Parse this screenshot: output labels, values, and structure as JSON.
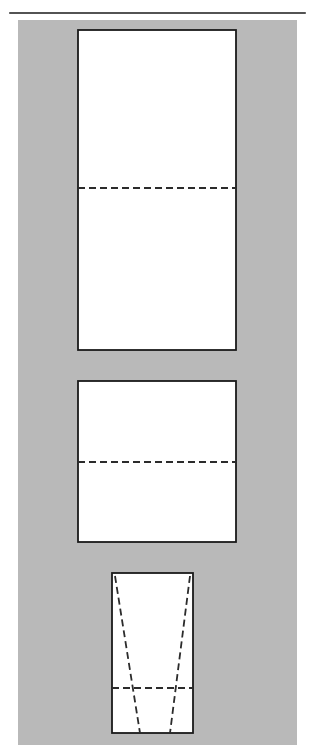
{
  "page": {
    "width": 315,
    "height": 755,
    "background_color": "#ffffff"
  },
  "colors": {
    "background": "#ffffff",
    "panel_gray": "#b9b9b9",
    "shape_fill": "#ffffff",
    "stroke": "#1a1a1a",
    "dashed_stroke": "#2b2b2b"
  },
  "top_rule": {
    "label": "horizontal-rule",
    "x1": 10,
    "y1": 13,
    "x2": 305,
    "y2": 13,
    "stroke_width": 1.6
  },
  "gray_panel": {
    "label": "gray-background-panel",
    "x": 18,
    "y": 20,
    "width": 279,
    "height": 725
  },
  "shapes": [
    {
      "id": "panel-1",
      "name": "upper-rectangle",
      "type": "rectangle",
      "x": 78,
      "y": 30,
      "width": 158,
      "height": 320,
      "stroke_width": 1.8,
      "fold_lines": [
        {
          "name": "horizontal-fold-line",
          "type": "dashed",
          "x1": 78,
          "y1": 188,
          "x2": 236,
          "y2": 188
        }
      ]
    },
    {
      "id": "panel-2",
      "name": "middle-rectangle",
      "type": "rectangle",
      "x": 78,
      "y": 381,
      "width": 158,
      "height": 161,
      "stroke_width": 1.8,
      "fold_lines": [
        {
          "name": "horizontal-fold-line",
          "type": "dashed",
          "x1": 78,
          "y1": 462,
          "x2": 236,
          "y2": 462
        }
      ]
    },
    {
      "id": "panel-3",
      "name": "lower-rectangle-with-taper",
      "type": "rectangle",
      "x": 112,
      "y": 573,
      "width": 81,
      "height": 160,
      "stroke_width": 1.8,
      "fold_lines": [
        {
          "name": "horizontal-fold-line",
          "type": "dashed",
          "x1": 112,
          "y1": 688,
          "x2": 193,
          "y2": 688
        },
        {
          "name": "left-taper-line",
          "type": "dashed",
          "x1": 115,
          "y1": 576,
          "x2": 140,
          "y2": 733
        },
        {
          "name": "right-taper-line",
          "type": "dashed",
          "x1": 190,
          "y1": 576,
          "x2": 170,
          "y2": 733
        }
      ]
    }
  ],
  "dash_pattern": {
    "dash": 7,
    "gap": 4,
    "stroke_width": 1.8
  }
}
